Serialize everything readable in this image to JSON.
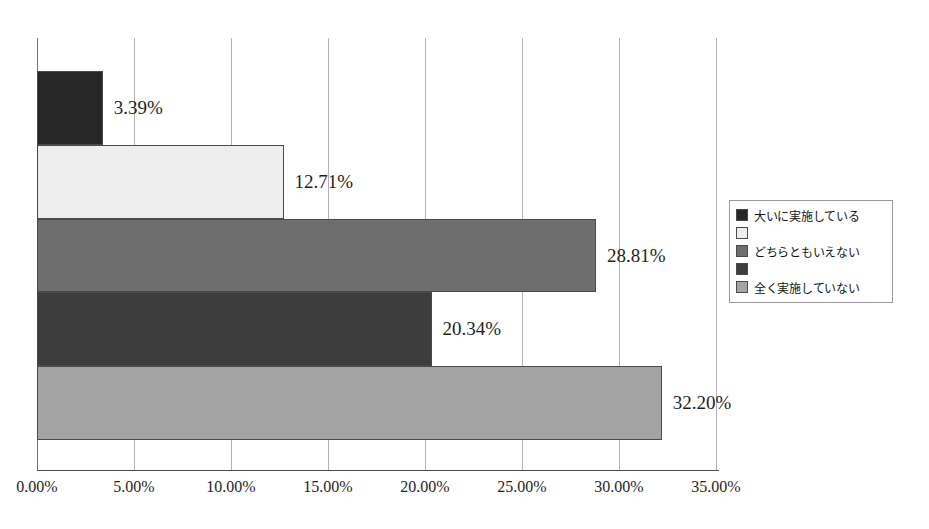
{
  "chart_data": {
    "type": "bar",
    "orientation": "horizontal",
    "title": "",
    "xlabel": "",
    "ylabel": "",
    "xlim": [
      0,
      35
    ],
    "grid": true,
    "legend_position": "right",
    "categories": [
      "大いに実施している",
      "",
      "どちらともいえない",
      "",
      "全く実施していない"
    ],
    "values": [
      3.39,
      12.71,
      28.81,
      20.34,
      32.2
    ],
    "data_labels": [
      "3.39%",
      "12.71%",
      "28.81%",
      "20.34%",
      "32.20%"
    ],
    "colors": [
      "#262626",
      "#ededed",
      "#6e6e6e",
      "#3d3d3d",
      "#a3a3a3"
    ],
    "tick_labels": [
      "0.00%",
      "5.00%",
      "10.00%",
      "15.00%",
      "20.00%",
      "25.00%",
      "30.00%",
      "35.00%"
    ],
    "tick_values": [
      0,
      5,
      10,
      15,
      20,
      25,
      30,
      35
    ]
  },
  "legend": {
    "items": [
      {
        "label": "大いに実施している",
        "color": "#262626"
      },
      {
        "label": "",
        "color": "#ededed"
      },
      {
        "label": "どちらともいえない",
        "color": "#6e6e6e"
      },
      {
        "label": "",
        "color": "#3d3d3d"
      },
      {
        "label": "全く実施していない",
        "color": "#a3a3a3"
      }
    ]
  },
  "axis": {
    "gridline_color": "#b4b4b4",
    "axis_color": "#4a4a4a"
  }
}
